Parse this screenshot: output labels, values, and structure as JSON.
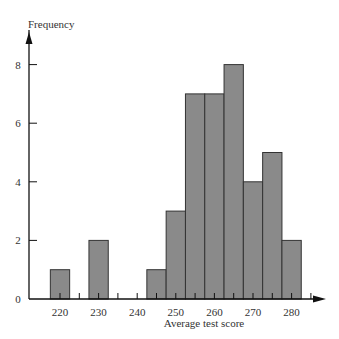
{
  "chart_data": {
    "type": "bar",
    "title": "",
    "xlabel": "Average test score",
    "ylabel": "Frequency",
    "categories": [
      "220",
      "225",
      "230",
      "235",
      "240",
      "245",
      "250",
      "255",
      "260",
      "265",
      "270",
      "275",
      "280"
    ],
    "bins": [
      {
        "center": 220,
        "value": 1
      },
      {
        "center": 230,
        "value": 2
      },
      {
        "center": 245,
        "value": 1
      },
      {
        "center": 250,
        "value": 3
      },
      {
        "center": 255,
        "value": 7
      },
      {
        "center": 260,
        "value": 7
      },
      {
        "center": 265,
        "value": 8
      },
      {
        "center": 270,
        "value": 4
      },
      {
        "center": 275,
        "value": 5
      },
      {
        "center": 280,
        "value": 2
      }
    ],
    "x_tick_labels": [
      "220",
      "230",
      "240",
      "250",
      "260",
      "270",
      "280"
    ],
    "y_tick_labels": [
      "0",
      "2",
      "4",
      "6",
      "8"
    ],
    "ylim": [
      0,
      9
    ],
    "xlim": [
      215,
      290
    ],
    "bin_width": 5,
    "bar_color": "#8a8a8a",
    "grid": false,
    "legend": null
  }
}
